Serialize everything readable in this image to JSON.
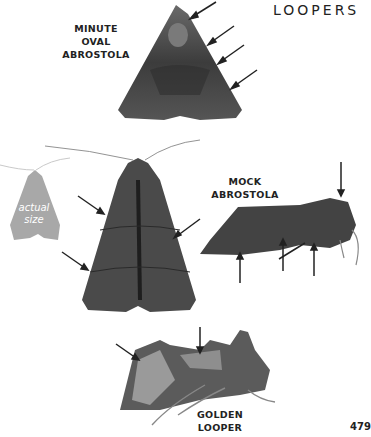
{
  "page": {
    "section_title": "LOOPERS",
    "page_number": "479"
  },
  "species": [
    {
      "name_line1": "MINUTE OVAL",
      "name_line2": "ABROSTOLA",
      "view": "dorsal",
      "arrow_count": 4
    },
    {
      "name_line1": "MOCK ABROSTOLA",
      "name_line2": "",
      "view": "dorsal-and-lateral",
      "arrow_count": 8
    },
    {
      "name_line1": "GOLDEN",
      "name_line2": "LOOPER",
      "view": "lateral",
      "arrow_count": 2
    }
  ],
  "actual_size": {
    "text_line1": "actual",
    "text_line2": "size",
    "color": "#a8a8a8"
  },
  "colors": {
    "moth_dark": "#3a3a3a",
    "moth_mid": "#5a5a5a",
    "moth_light": "#8a8a8a",
    "arrow": "#222222",
    "text": "#222222"
  }
}
